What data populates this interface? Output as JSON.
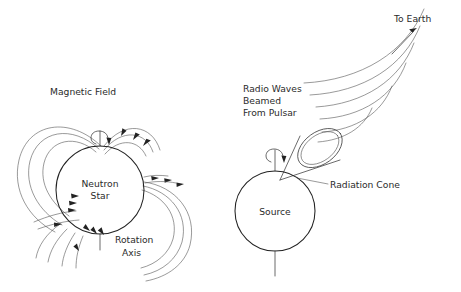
{
  "figure": {
    "background_color": "#ffffff",
    "line_color": "#3a3a3a",
    "text_color": "#2b2b2b",
    "width": 461,
    "height": 292
  },
  "left_panel": {
    "name": "neutron-star-magnetic-field",
    "labels": {
      "magnetic_field": "Magnetic Field",
      "neutron_star_line1": "Neutron",
      "neutron_star_line2": "Star",
      "rotation_axis_line1": "Rotation",
      "rotation_axis_line2": "Axis"
    },
    "star": {
      "center_x": 100,
      "center_y": 190,
      "radius": 44
    },
    "field_line_count": 8,
    "rotation_marker": "rotation-spiral-arrow"
  },
  "right_panel": {
    "name": "pulsar-radiation-cone",
    "labels": {
      "radio_waves_line1": "Radio Waves",
      "radio_waves_line2": "Beamed",
      "radio_waves_line3": "From Pulsar",
      "to_earth": "To Earth",
      "radiation_cone": "Radiation Cone",
      "source": "Source"
    },
    "source": {
      "center_x": 275,
      "center_y": 211,
      "radius": 40
    },
    "wave_arc_count": 6,
    "cone_mouth": "double-ellipse",
    "rotation_marker": "rotation-spiral-arrow",
    "earth_arrow_direction": "up-right"
  }
}
